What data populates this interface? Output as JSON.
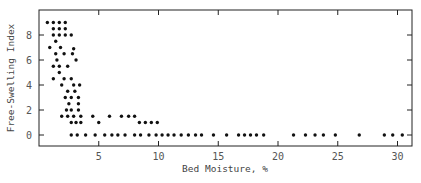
{
  "chart_data": {
    "type": "scatter",
    "title": "",
    "xlabel": "Bed Moisture, %",
    "ylabel": "Free-Swelling Index",
    "xlim": [
      0,
      31.1
    ],
    "ylim": [
      -0.9,
      10
    ],
    "xticks": [
      5,
      10,
      15,
      20,
      25,
      30
    ],
    "yticks": [
      0,
      2,
      4,
      6,
      8
    ],
    "grid": false,
    "legend": null,
    "marker_color": "#111111",
    "points": [
      {
        "x": 0.7,
        "y": 9.0
      },
      {
        "x": 1.2,
        "y": 9.0
      },
      {
        "x": 1.7,
        "y": 9.0
      },
      {
        "x": 2.2,
        "y": 9.0
      },
      {
        "x": 1.2,
        "y": 8.5
      },
      {
        "x": 1.7,
        "y": 8.5
      },
      {
        "x": 2.2,
        "y": 8.5
      },
      {
        "x": 1.2,
        "y": 8.0
      },
      {
        "x": 1.7,
        "y": 8.0
      },
      {
        "x": 2.2,
        "y": 8.0
      },
      {
        "x": 2.7,
        "y": 8.0
      },
      {
        "x": 1.4,
        "y": 7.5
      },
      {
        "x": 0.9,
        "y": 7.0
      },
      {
        "x": 1.8,
        "y": 7.0
      },
      {
        "x": 2.9,
        "y": 6.9
      },
      {
        "x": 1.4,
        "y": 6.5
      },
      {
        "x": 2.1,
        "y": 6.5
      },
      {
        "x": 2.8,
        "y": 6.5
      },
      {
        "x": 1.5,
        "y": 6.0
      },
      {
        "x": 3.1,
        "y": 6.0
      },
      {
        "x": 1.2,
        "y": 5.5
      },
      {
        "x": 1.7,
        "y": 5.5
      },
      {
        "x": 2.4,
        "y": 5.5
      },
      {
        "x": 1.7,
        "y": 5.0
      },
      {
        "x": 1.2,
        "y": 4.5
      },
      {
        "x": 2.1,
        "y": 4.5
      },
      {
        "x": 2.7,
        "y": 4.5
      },
      {
        "x": 1.9,
        "y": 4.0
      },
      {
        "x": 2.9,
        "y": 4.0
      },
      {
        "x": 3.4,
        "y": 4.0
      },
      {
        "x": 2.4,
        "y": 3.5
      },
      {
        "x": 3.0,
        "y": 3.5
      },
      {
        "x": 2.2,
        "y": 3.0
      },
      {
        "x": 2.7,
        "y": 3.0
      },
      {
        "x": 3.3,
        "y": 3.0
      },
      {
        "x": 2.5,
        "y": 2.5
      },
      {
        "x": 3.3,
        "y": 2.5
      },
      {
        "x": 2.3,
        "y": 2.0
      },
      {
        "x": 2.7,
        "y": 2.0
      },
      {
        "x": 3.3,
        "y": 2.0
      },
      {
        "x": 1.9,
        "y": 1.5
      },
      {
        "x": 2.4,
        "y": 1.5
      },
      {
        "x": 2.9,
        "y": 1.5
      },
      {
        "x": 3.5,
        "y": 1.5
      },
      {
        "x": 4.5,
        "y": 1.5
      },
      {
        "x": 5.9,
        "y": 1.5
      },
      {
        "x": 6.9,
        "y": 1.5
      },
      {
        "x": 7.5,
        "y": 1.5
      },
      {
        "x": 8.0,
        "y": 1.5
      },
      {
        "x": 2.7,
        "y": 1.0
      },
      {
        "x": 3.1,
        "y": 1.0
      },
      {
        "x": 3.5,
        "y": 1.0
      },
      {
        "x": 5.0,
        "y": 1.0
      },
      {
        "x": 8.4,
        "y": 1.0
      },
      {
        "x": 8.9,
        "y": 1.0
      },
      {
        "x": 9.4,
        "y": 1.0
      },
      {
        "x": 9.9,
        "y": 1.0
      },
      {
        "x": 2.7,
        "y": 0
      },
      {
        "x": 3.2,
        "y": 0
      },
      {
        "x": 3.9,
        "y": 0
      },
      {
        "x": 4.7,
        "y": 0
      },
      {
        "x": 5.5,
        "y": 0
      },
      {
        "x": 6.1,
        "y": 0
      },
      {
        "x": 6.6,
        "y": 0
      },
      {
        "x": 7.2,
        "y": 0
      },
      {
        "x": 8.0,
        "y": 0
      },
      {
        "x": 8.5,
        "y": 0
      },
      {
        "x": 9.2,
        "y": 0
      },
      {
        "x": 9.8,
        "y": 0
      },
      {
        "x": 10.3,
        "y": 0
      },
      {
        "x": 10.8,
        "y": 0
      },
      {
        "x": 11.3,
        "y": 0
      },
      {
        "x": 11.9,
        "y": 0
      },
      {
        "x": 12.5,
        "y": 0
      },
      {
        "x": 13.1,
        "y": 0
      },
      {
        "x": 13.6,
        "y": 0
      },
      {
        "x": 14.6,
        "y": 0
      },
      {
        "x": 15.7,
        "y": 0
      },
      {
        "x": 16.7,
        "y": 0
      },
      {
        "x": 17.2,
        "y": 0
      },
      {
        "x": 17.7,
        "y": 0
      },
      {
        "x": 18.2,
        "y": 0
      },
      {
        "x": 18.8,
        "y": 0
      },
      {
        "x": 21.3,
        "y": 0
      },
      {
        "x": 22.3,
        "y": 0
      },
      {
        "x": 23.1,
        "y": 0
      },
      {
        "x": 23.8,
        "y": 0
      },
      {
        "x": 24.8,
        "y": 0
      },
      {
        "x": 26.8,
        "y": 0
      },
      {
        "x": 28.9,
        "y": 0
      },
      {
        "x": 29.6,
        "y": 0
      },
      {
        "x": 30.4,
        "y": 0
      }
    ]
  }
}
